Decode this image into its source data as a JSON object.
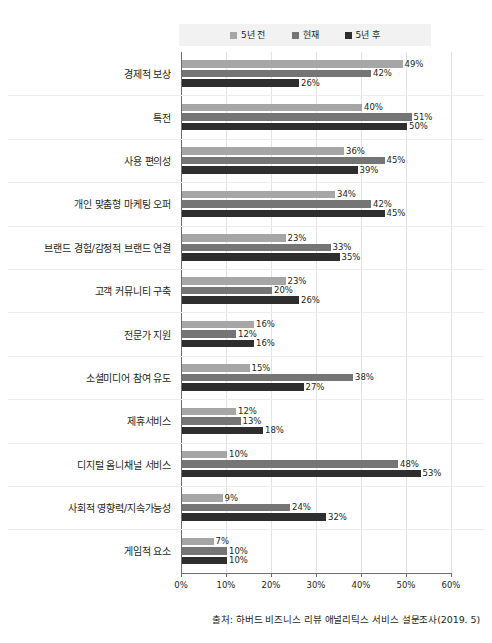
{
  "chart_data": {
    "type": "bar",
    "orientation": "horizontal",
    "title": "",
    "xlabel": "",
    "ylabel": "",
    "xlim": [
      0,
      60
    ],
    "xticks": [
      "0%",
      "10%",
      "20%",
      "30%",
      "40%",
      "50%",
      "60%"
    ],
    "grid": true,
    "legend_position": "top",
    "value_suffix": "%",
    "categories": [
      "경제적 보상",
      "특전",
      "사용 편의성",
      "개인 맞춤형 마케팅 오퍼",
      "브랜드 경험/감정적 브랜드 연결",
      "고객 커뮤니티 구축",
      "전문가 지원",
      "소셜미디어 참여 유도",
      "제휴서비스",
      "디지털 옴니채널 서비스",
      "사회적 영향력/지속가능성",
      "게임적 요소"
    ],
    "series": [
      {
        "name": "5년 전",
        "color": "#a6a6a6",
        "values": [
          49,
          40,
          36,
          34,
          23,
          23,
          16,
          15,
          12,
          10,
          9,
          7
        ],
        "labels": [
          "49%",
          "40%",
          "36%",
          "34%",
          "23%",
          "23%",
          "16%",
          "15%",
          "12%",
          "10%",
          "9%",
          "7%"
        ]
      },
      {
        "name": "현재",
        "color": "#757575",
        "values": [
          42,
          51,
          45,
          42,
          33,
          20,
          12,
          38,
          13,
          48,
          24,
          10
        ],
        "labels": [
          "42%",
          "51%",
          "45%",
          "42%",
          "33%",
          "20%",
          "12%",
          "38%",
          "13%",
          "48%",
          "24%",
          "10%"
        ]
      },
      {
        "name": "5년 후",
        "color": "#2e2e2e",
        "values": [
          26,
          50,
          39,
          45,
          35,
          26,
          16,
          27,
          18,
          53,
          32,
          10
        ],
        "labels": [
          "26%",
          "50%",
          "39%",
          "45%",
          "35%",
          "26%",
          "16%",
          "27%",
          "18%",
          "53%",
          "32%",
          "10%"
        ]
      }
    ],
    "source": "출처: 하버드 비즈니스 리뷰 애널리틱스 서비스 설문조사(2019. 5)"
  }
}
